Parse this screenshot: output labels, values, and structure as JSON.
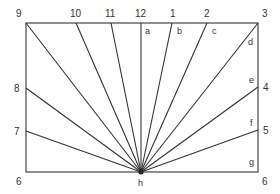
{
  "diagram": {
    "colors": {
      "line": "#333333",
      "text": "#333333",
      "background": "#ffffff"
    },
    "hub": {
      "id": "h",
      "label": "h"
    },
    "corner_labels": {
      "top_left": "9",
      "top_right": "3",
      "bottom_left": "6",
      "bottom_right": "6"
    },
    "top_labels": [
      "10",
      "11",
      "12",
      "1",
      "2"
    ],
    "left_labels": [
      "8",
      "7"
    ],
    "right_labels": [
      "4",
      "5"
    ],
    "region_letters": [
      "a",
      "b",
      "c",
      "d",
      "e",
      "f",
      "g"
    ]
  }
}
